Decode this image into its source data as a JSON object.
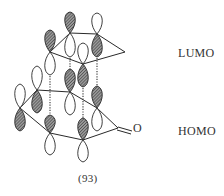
{
  "figure": {
    "compound_label": "(93)",
    "carbonyl_atom": "O",
    "levels": {
      "upper": "LUMO",
      "lower": "HOMO"
    }
  },
  "colors": {
    "ink": "#2a2a2a",
    "shaded_lobe_fill": "#6b6b6b",
    "open_lobe_fill": "#ffffff",
    "background": "#ffffff"
  }
}
